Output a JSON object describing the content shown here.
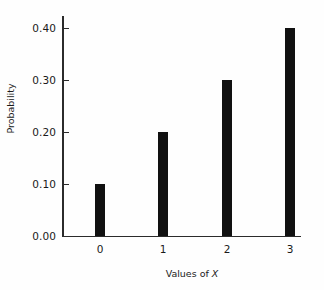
{
  "chart_data": {
    "type": "bar",
    "title": "",
    "subtitle": "",
    "categories": [
      "0",
      "1",
      "2",
      "3"
    ],
    "values": [
      0.1,
      0.2,
      0.3,
      0.4
    ],
    "value_labels": [
      "0.10",
      "0.20",
      "0.30",
      "0.40"
    ],
    "xlabel_prefix": "Values of",
    "xlabel_variable": "X",
    "xlabel": "Values of X",
    "ylabel": "Probability",
    "ylim": [
      0.0,
      0.4
    ],
    "xlim": [
      -0.5,
      3.5
    ],
    "yticks": [
      0.0,
      0.1,
      0.2,
      0.3,
      0.4
    ],
    "ytick_labels": [
      "0.00",
      "0.10",
      "0.20",
      "0.30",
      "0.40"
    ],
    "xtick_labels": [
      "0",
      "1",
      "2",
      "3"
    ],
    "grid": false,
    "legend": false,
    "legend_position": "none",
    "bar_color": "#111111",
    "axis_color": "#2b2b2b",
    "background_color": "#fefefe",
    "tick_direction": "in",
    "spines": [
      "left",
      "bottom"
    ]
  },
  "figure": {
    "name": "probability-distribution-bar-chart"
  }
}
